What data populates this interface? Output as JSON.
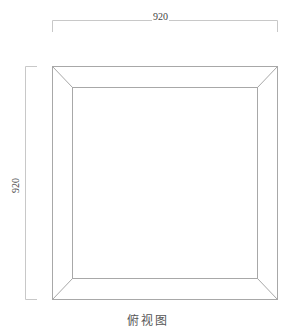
{
  "drawing": {
    "caption": "俯视图",
    "dimensions": {
      "width_label": "920",
      "height_label": "920"
    },
    "colors": {
      "line": "#bdbdbd",
      "frame": "#9e9e9e",
      "text": "#444444"
    }
  }
}
